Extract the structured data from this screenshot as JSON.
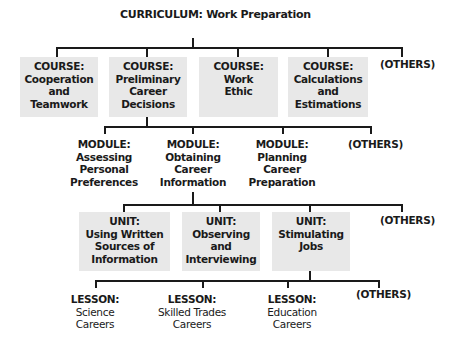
{
  "curriculum": {
    "kind": "CURRICULUM:",
    "name": "Work Preparation"
  },
  "courses": [
    {
      "kind": "COURSE:",
      "lines": [
        "Cooperation",
        "and",
        "Teamwork"
      ]
    },
    {
      "kind": "COURSE:",
      "lines": [
        "Preliminary",
        "Career",
        "Decisions"
      ]
    },
    {
      "kind": "COURSE:",
      "lines": [
        "Work",
        "Ethic",
        ""
      ]
    },
    {
      "kind": "COURSE:",
      "lines": [
        "Calculations",
        "and",
        "Estimations"
      ]
    }
  ],
  "courses_others": "(OTHERS)",
  "modules": [
    {
      "kind": "MODULE:",
      "lines": [
        "Assessing",
        "Personal",
        "Preferences"
      ]
    },
    {
      "kind": "MODULE:",
      "lines": [
        "Obtaining",
        "Career",
        "Information"
      ]
    },
    {
      "kind": "MODULE:",
      "lines": [
        "Planning",
        "Career",
        "Preparation"
      ]
    }
  ],
  "modules_others": "(OTHERS)",
  "units": [
    {
      "kind": "UNIT:",
      "lines": [
        "Using Written",
        "Sources of",
        "Information"
      ]
    },
    {
      "kind": "UNIT:",
      "lines": [
        "Observing",
        "and",
        "Interviewing"
      ]
    },
    {
      "kind": "UNIT:",
      "lines": [
        "Stimulating",
        "Jobs",
        ""
      ]
    }
  ],
  "units_others": "(OTHERS)",
  "lessons": [
    {
      "kind": "LESSON:",
      "lines": [
        "Science",
        "Careers"
      ]
    },
    {
      "kind": "LESSON:",
      "lines": [
        "Skilled Trades",
        "Careers"
      ]
    },
    {
      "kind": "LESSON:",
      "lines": [
        "Education",
        "Careers"
      ]
    }
  ],
  "lessons_others": "(OTHERS)",
  "colors": {
    "box_fill": "#e8e8e8",
    "line": "#1a1a1a",
    "text": "#1a1a1a"
  }
}
